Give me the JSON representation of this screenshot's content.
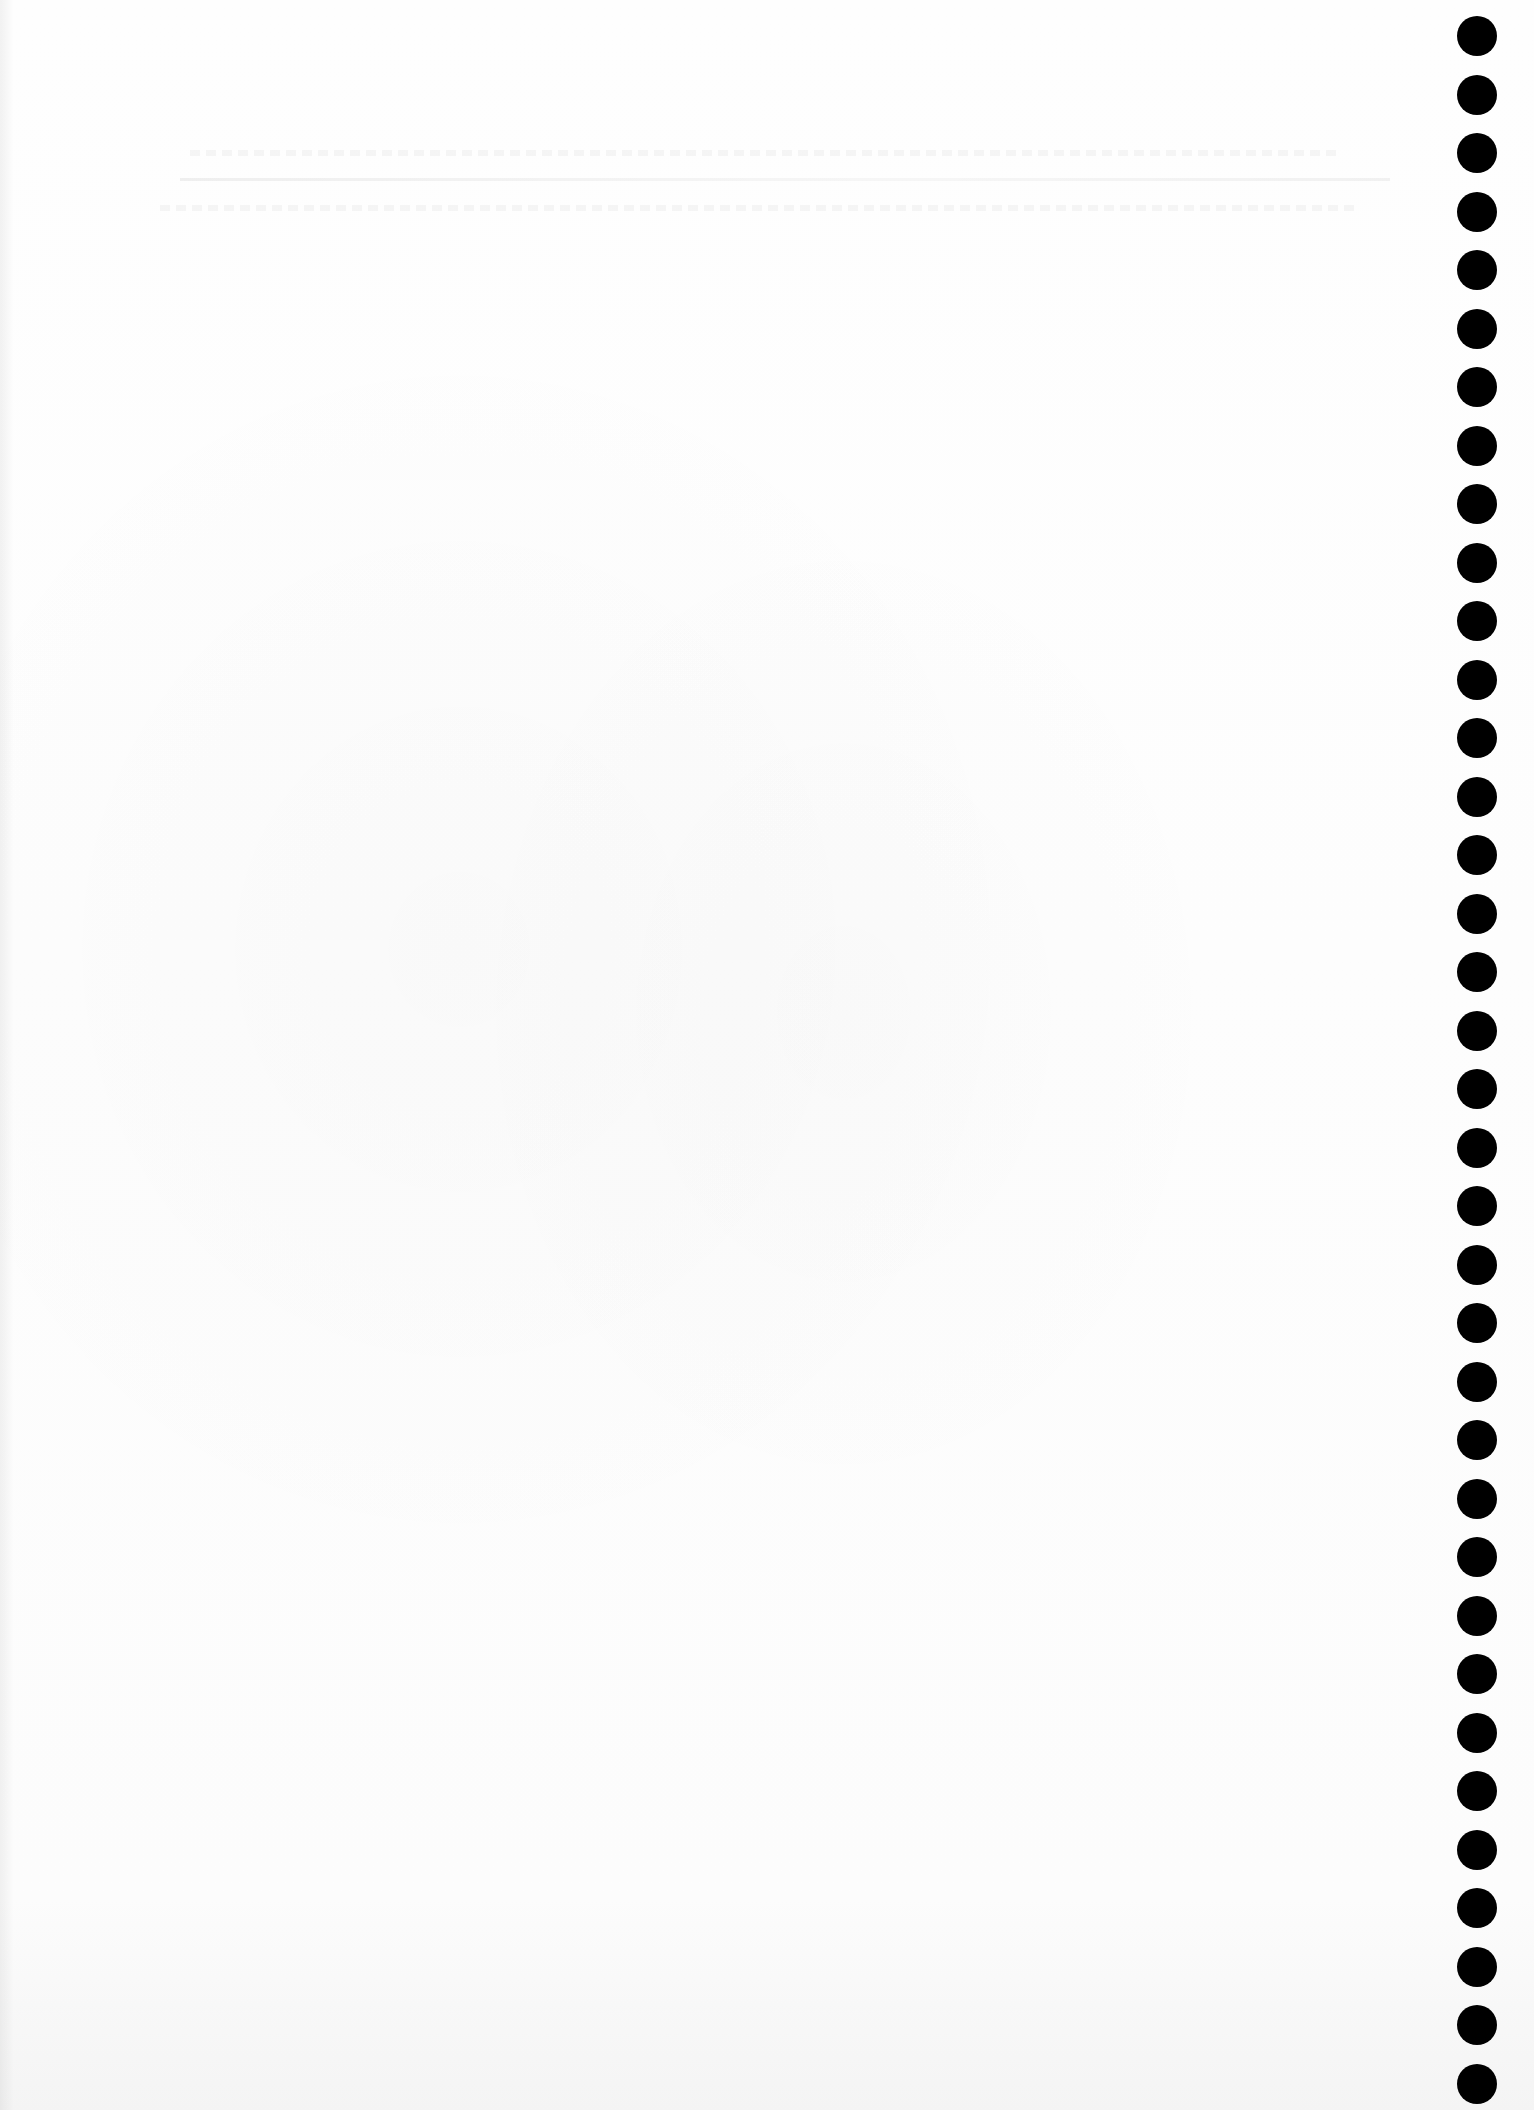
{
  "document": {
    "type": "blank scanned page",
    "content": "",
    "punch_holes": {
      "count": 36,
      "side": "right",
      "center_x": 1477,
      "first_center_y": 36,
      "spacing": 58.5,
      "diameter": 40,
      "color": "#000000"
    },
    "background_color": "#fdfdfd"
  }
}
